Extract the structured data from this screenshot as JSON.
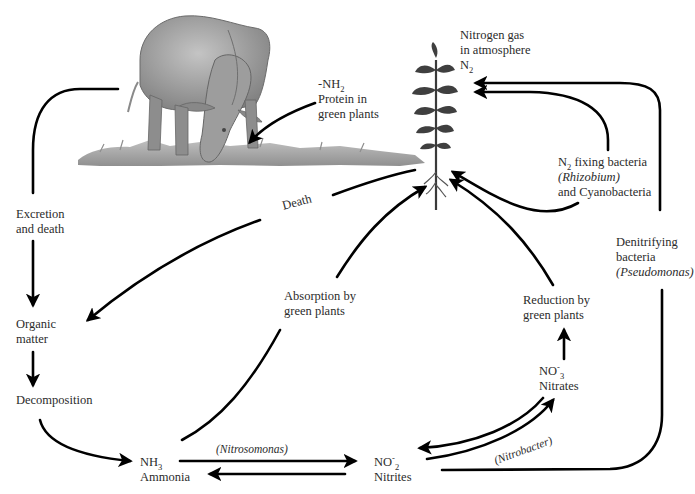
{
  "diagram": {
    "colors": {
      "arrow": "#000000",
      "text": "#2b2b2b",
      "grass": "#8a8a8a",
      "animal": "#9a9a9a",
      "plant": "#3d3d3d"
    },
    "illustrations": {
      "animal": "grazing-buffalo",
      "plant": "green-plant-with-roots"
    },
    "nodes": {
      "atmosphere": {
        "line1": "Nitrogen gas",
        "line2": "in atmosphere",
        "formula_base": "N",
        "formula_sub": "2"
      },
      "protein": {
        "formula_prefix": "-NH",
        "formula_sub": "2",
        "line1": "Protein in",
        "line2": "green plants"
      },
      "fixing": {
        "formula_base": "N",
        "formula_sub": "2",
        "line1_rest": " fixing bacteria",
        "line2": "(Rhizobium)",
        "line3": "and Cyanobacteria"
      },
      "denitrifying": {
        "line1": "Denitrifying",
        "line2": "bacteria",
        "line3": "(Pseudomonas)"
      },
      "excretion": {
        "line1": "Excretion",
        "line2": "and death"
      },
      "organic": {
        "line1": "Organic",
        "line2": "matter"
      },
      "decomposition": {
        "line1": "Decomposition"
      },
      "death": {
        "label": "Death"
      },
      "absorption": {
        "line1": "Absorption by",
        "line2": "green plants"
      },
      "reduction": {
        "line1": "Reduction by",
        "line2": "green plants"
      },
      "nitrates": {
        "formula_base": "NO",
        "formula_sup": "-",
        "formula_sub": "3",
        "line2": "Nitrates"
      },
      "ammonia": {
        "formula_base": "NH",
        "formula_sub": "3",
        "line2": "Ammonia"
      },
      "nitrites": {
        "formula_base": "NO",
        "formula_sup": "-",
        "formula_sub": "2",
        "line2": "Nitrites"
      },
      "nitrosomonas": {
        "label": "(Nitrosomonas)"
      },
      "nitrobacter": {
        "label": "(Nitrobacter)"
      }
    },
    "edges": [
      {
        "from": "animal",
        "to": "excretion"
      },
      {
        "from": "excretion",
        "to": "organic"
      },
      {
        "from": "organic",
        "to": "decomposition"
      },
      {
        "from": "decomposition",
        "to": "ammonia"
      },
      {
        "from": "plant",
        "to": "organic",
        "label": "Death"
      },
      {
        "from": "protein",
        "to": "animal"
      },
      {
        "from": "ammonia",
        "to": "plant",
        "label": "Absorption by green plants"
      },
      {
        "from": "ammonia",
        "to": "nitrites",
        "label": "(Nitrosomonas)"
      },
      {
        "from": "nitrites",
        "to": "ammonia"
      },
      {
        "from": "nitrites",
        "to": "nitrates",
        "label": "(Nitrobacter)"
      },
      {
        "from": "nitrates",
        "to": "nitrites"
      },
      {
        "from": "nitrates",
        "to": "plant",
        "label": "Reduction by green plants"
      },
      {
        "from": "atmosphere",
        "to": "plant",
        "label": "N2 fixing bacteria (Rhizobium) and Cyanobacteria"
      },
      {
        "from": "nitrites",
        "to": "atmosphere",
        "label": "Denitrifying bacteria (Pseudomonas)"
      }
    ]
  }
}
